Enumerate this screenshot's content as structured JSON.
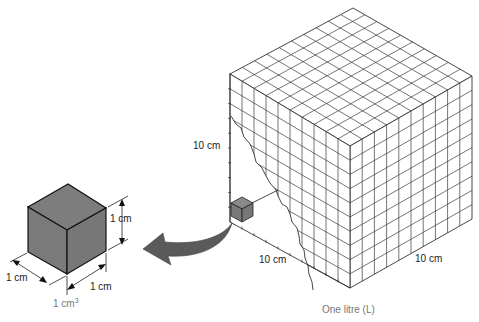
{
  "figure": {
    "small_cube": {
      "height_label": "1 cm",
      "depth_label": "1 cm",
      "width_label": "1 cm",
      "volume_label": "1 cm",
      "volume_superscript": "3",
      "fill_color": "#7a7a7a"
    },
    "large_cube": {
      "height_label": "10 cm",
      "depth_label": "10 cm",
      "width_label": "10 cm",
      "caption": "One litre (L)",
      "divisions": 10,
      "inner_cube_fill": "#7a7a7a"
    },
    "arrow": {
      "color": "#555555",
      "direction": "from large cube interior to small cube"
    }
  }
}
